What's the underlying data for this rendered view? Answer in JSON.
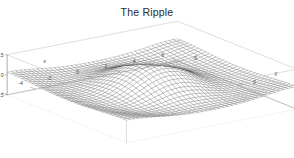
{
  "chart_data": {
    "type": "surface",
    "title": "The Ripple",
    "xlabel": "x",
    "ylabel": "y",
    "zlabel": "z",
    "xlim": [
      -6,
      6
    ],
    "ylim": [
      -5,
      5
    ],
    "zlim": [
      -0.5,
      0.5
    ],
    "xticks": [
      "-6",
      "-4",
      "-2",
      "0",
      "2",
      "4",
      "6"
    ],
    "xtick_values": [
      -6,
      -4,
      -2,
      0,
      2,
      4,
      6
    ],
    "yticks": [
      "-5",
      "0",
      "5"
    ],
    "ytick_values": [
      -5,
      0,
      5
    ],
    "zticks": [
      "-0.5",
      "0",
      "0.5"
    ],
    "ztick_values": [
      -0.5,
      0,
      0.5
    ],
    "function": "z = sin(sqrt(x^2 + y^2)) / sqrt(x^2 + y^2)",
    "grid": false,
    "legend": "none",
    "projection": "persp",
    "mesh_n_x": 40,
    "mesh_n_y": 34,
    "surface_color": "#ffffff",
    "mesh_color": "#3c3c3c",
    "box_color": "#8a8a8a",
    "background_color": "#ffffff",
    "z_peak_center": 1.0,
    "z_ring_trough": -0.217,
    "z_outer_ridge": 0.128
  },
  "title": {
    "text": "The Ripple"
  },
  "axes": {
    "x": {
      "label": "x",
      "ticks": [
        "-6",
        "-4",
        "-2",
        "0",
        "2",
        "4",
        "6"
      ]
    },
    "y": {
      "label": "y",
      "ticks": [
        "-5",
        "0",
        "5"
      ]
    },
    "z": {
      "label": "z",
      "ticks": [
        "0.5",
        "0",
        "-0.5"
      ]
    }
  }
}
